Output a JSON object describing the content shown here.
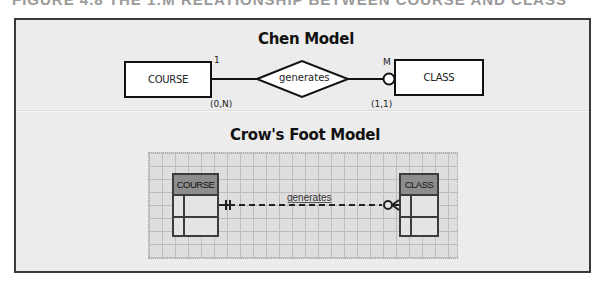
{
  "figure": {
    "caption": "FIGURE 4.8  THE 1:M RELATIONSHIP BETWEEN COURSE AND CLASS"
  },
  "chen": {
    "title": "Chen Model",
    "entity_left": "COURSE",
    "entity_right": "CLASS",
    "relationship": "generates",
    "cardinality_left": "1",
    "cardinality_right": "M",
    "connectivity_left": "(0,N)",
    "connectivity_right": "(1,1)"
  },
  "crowsfoot": {
    "title": "Crow's Foot Model",
    "table_left": "COURSE",
    "table_right": "CLASS",
    "relationship": "generates",
    "left_end": "mandatory-one",
    "right_end": "optional-many"
  },
  "colors": {
    "frame_bg": "#ececec",
    "frame_border": "#3a3a3a",
    "grid_bg": "#dedede",
    "table_header": "#8d8d8d"
  }
}
